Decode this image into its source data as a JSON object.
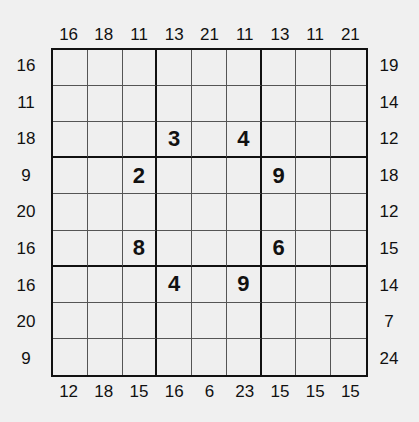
{
  "puzzle": {
    "type": "sudoku-outside-sums",
    "size": 9,
    "clues": {
      "top": [
        "16",
        "18",
        "11",
        "13",
        "21",
        "11",
        "13",
        "11",
        "21"
      ],
      "bottom": [
        "12",
        "18",
        "15",
        "16",
        "6",
        "23",
        "15",
        "15",
        "15"
      ],
      "left": [
        "16",
        "11",
        "18",
        "9",
        "20",
        "16",
        "16",
        "20",
        "9"
      ],
      "right": [
        "19",
        "14",
        "12",
        "18",
        "12",
        "15",
        "14",
        "7",
        "24"
      ]
    },
    "grid": [
      [
        "",
        "",
        "",
        "",
        "",
        "",
        "",
        "",
        ""
      ],
      [
        "",
        "",
        "",
        "",
        "",
        "",
        "",
        "",
        ""
      ],
      [
        "",
        "",
        "",
        "3",
        "",
        "4",
        "",
        "",
        ""
      ],
      [
        "",
        "",
        "2",
        "",
        "",
        "",
        "9",
        "",
        ""
      ],
      [
        "",
        "",
        "",
        "",
        "",
        "",
        "",
        "",
        ""
      ],
      [
        "",
        "",
        "8",
        "",
        "",
        "",
        "6",
        "",
        ""
      ],
      [
        "",
        "",
        "",
        "4",
        "",
        "9",
        "",
        "",
        ""
      ],
      [
        "",
        "",
        "",
        "",
        "",
        "",
        "",
        "",
        ""
      ],
      [
        "",
        "",
        "",
        "",
        "",
        "",
        "",
        "",
        ""
      ]
    ]
  }
}
